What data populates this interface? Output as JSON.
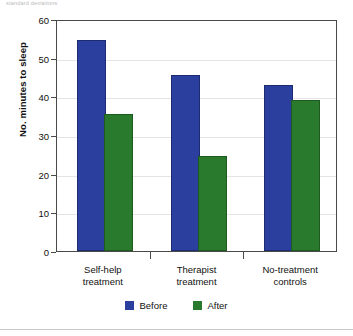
{
  "caption_clip": "standard deviations",
  "chart_data": {
    "type": "bar",
    "title": "",
    "xlabel": "",
    "ylabel": "No. minutes to sleep",
    "ylim": [
      0,
      60
    ],
    "yticks": [
      0,
      10,
      20,
      30,
      40,
      50,
      60
    ],
    "ytick_labels": [
      "0",
      "10",
      "20",
      "30",
      "40",
      "50",
      "60"
    ],
    "grid": true,
    "legend_position": "bottom-center",
    "categories": [
      "Self-help\ntreatment",
      "Therapist\ntreatment",
      "No-treatment\ncontrols"
    ],
    "category_lines": [
      [
        "Self-help",
        "treatment"
      ],
      [
        "Therapist",
        "treatment"
      ],
      [
        "No-treatment",
        "controls"
      ]
    ],
    "series": [
      {
        "name": "Before",
        "color": "#2b3f9e",
        "values": [
          54,
          45,
          42.5
        ]
      },
      {
        "name": "After",
        "color": "#2a7a2e",
        "values": [
          35,
          24,
          38.5
        ]
      }
    ]
  },
  "legend": {
    "items": [
      {
        "label": "Before",
        "color": "#2b3f9e"
      },
      {
        "label": "After",
        "color": "#2a7a2e"
      }
    ]
  },
  "colors": {
    "before": "#2b3f9e",
    "after": "#2a7a2e",
    "axis": "#4a4a4a",
    "grid": "#e4e4e4",
    "background": "#ffffff"
  }
}
